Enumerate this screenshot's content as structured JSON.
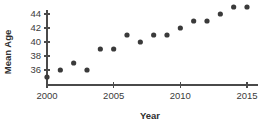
{
  "chart_data": {
    "type": "scatter",
    "title": "",
    "xlabel": "Year",
    "ylabel": "Mean Age",
    "xlim": [
      2000,
      2015.6
    ],
    "ylim": [
      34.6,
      45.6
    ],
    "grid": false,
    "legend": null,
    "xticks": [
      2000,
      2005,
      2010,
      2015
    ],
    "xtick_labels": [
      "2000",
      "2005",
      "2010",
      "2015"
    ],
    "yticks": [
      36,
      38,
      40,
      42,
      44
    ],
    "ytick_labels": [
      "36",
      "38",
      "40",
      "42",
      "44"
    ],
    "marker_color": "#3a3a3a",
    "axis_color": "#4a4a4a",
    "x": [
      2000,
      2001,
      2002,
      2003,
      2004,
      2005,
      2006,
      2007,
      2008,
      2009,
      2010,
      2011,
      2012,
      2013,
      2014,
      2015
    ],
    "values": [
      35,
      36,
      37,
      36,
      39,
      39,
      41,
      40,
      41,
      41,
      42,
      43,
      43,
      44,
      45,
      45
    ],
    "points": [
      {
        "x": 2000,
        "y": 35
      },
      {
        "x": 2001,
        "y": 36
      },
      {
        "x": 2002,
        "y": 37
      },
      {
        "x": 2003,
        "y": 36
      },
      {
        "x": 2004,
        "y": 39
      },
      {
        "x": 2005,
        "y": 39
      },
      {
        "x": 2006,
        "y": 41
      },
      {
        "x": 2007,
        "y": 40
      },
      {
        "x": 2008,
        "y": 41
      },
      {
        "x": 2009,
        "y": 41
      },
      {
        "x": 2010,
        "y": 42
      },
      {
        "x": 2011,
        "y": 43
      },
      {
        "x": 2012,
        "y": 43
      },
      {
        "x": 2013,
        "y": 44
      },
      {
        "x": 2014,
        "y": 45
      },
      {
        "x": 2015,
        "y": 45
      }
    ]
  }
}
